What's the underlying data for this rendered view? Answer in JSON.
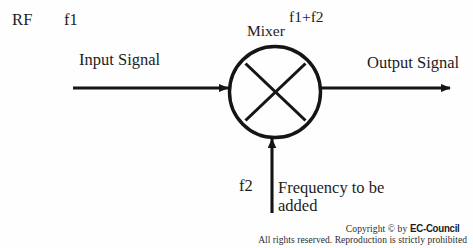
{
  "diagram": {
    "type": "block-diagram",
    "background_color": "#fffefe",
    "stroke_color": "#151515",
    "labels": {
      "rf": "RF",
      "f1": "f1",
      "input_signal": "Input Signal",
      "mixer": "Mixer",
      "f1_plus_f2": "f1+f2",
      "output_signal": "Output Signal",
      "f2": "f2",
      "frequency_line1": "Frequency to be",
      "frequency_line2": "added"
    },
    "nodes": [
      {
        "name": "mixer-symbol",
        "shape": "circle-with-x",
        "center_x": 275,
        "center_y": 92,
        "radius": 46,
        "label": "Mixer"
      }
    ],
    "arrows": [
      {
        "name": "input-signal-arrow",
        "direction": "right",
        "from_x": 73,
        "from_y": 88,
        "to_x": 229,
        "to_y": 88,
        "label": "Input Signal"
      },
      {
        "name": "output-signal-arrow",
        "direction": "right",
        "from_x": 320,
        "from_y": 88,
        "to_x": 451,
        "to_y": 88,
        "label": "Output Signal"
      },
      {
        "name": "local-oscillator-arrow",
        "direction": "up",
        "from_x": 272,
        "from_y": 213,
        "to_x": 272,
        "to_y": 138,
        "label": "f2"
      }
    ]
  },
  "footer": {
    "copyright_prefix": "Copyright © by ",
    "brand": "EC-Council",
    "rights": "All rights reserved. Reproduction is strictly prohibited"
  }
}
